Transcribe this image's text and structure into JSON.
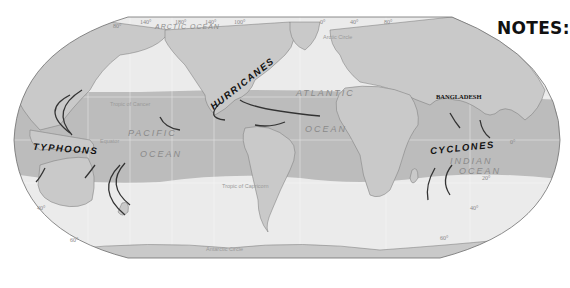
{
  "notes_label": "NOTES:",
  "colors": {
    "land": "#c9c9c9",
    "ocean": "#ececec",
    "storm_band": "#bdbdbd",
    "border": "#6e6e6e",
    "arrow": "#333333"
  },
  "map": {
    "oceans": {
      "arctic": "ARCTIC OCEAN",
      "arctic_circle_top": "Arctic Circle",
      "pacific_1": "PACIFIC",
      "pacific_2": "OCEAN",
      "atlantic_1": "ATLANTIC",
      "atlantic_2": "OCEAN",
      "indian_1": "INDIAN",
      "indian_2": "OCEAN"
    },
    "lines": {
      "tropic_cancer": "Tropic of Cancer",
      "equator": "Equator",
      "tropic_capricorn": "Tropic of Capricorn",
      "antarctic_circle": "Antarctic Circle"
    },
    "storms": {
      "hurricanes": "HURRICANES",
      "typhoons": "TYPHOONS",
      "cyclones": "CYCLONES"
    },
    "places": {
      "bangladesh": "BANGLADESH"
    },
    "degrees": {
      "top": [
        "80°",
        "140°",
        "180°",
        "140°",
        "100°",
        "0°",
        "40°",
        "80°"
      ],
      "lat_left_40": "40°",
      "lat_left_60": "60°",
      "lat_right_0": "0°",
      "lat_right_20": "20°",
      "lat_right_40": "40°",
      "lat_right_60": "60°"
    }
  }
}
